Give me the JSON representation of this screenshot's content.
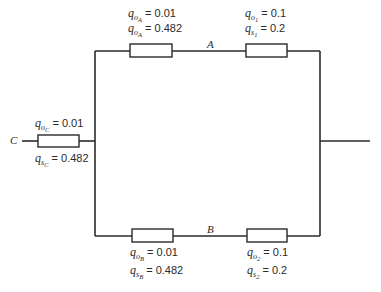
{
  "diagram": {
    "type": "reliability-network",
    "nodes": {
      "input": "C",
      "upper_branch": "A",
      "lower_branch": "B"
    },
    "components": {
      "C": {
        "q0": {
          "symbol": "q",
          "sub": "o",
          "subsub": "C",
          "eq": "= 0.01"
        },
        "qs": {
          "symbol": "q",
          "sub": "s",
          "subsub": "C",
          "eq": "= 0.482"
        }
      },
      "A_first": {
        "q0": {
          "symbol": "q",
          "sub": "o",
          "subsub": "A",
          "eq": "= 0.01"
        },
        "qs": {
          "symbol": "q",
          "sub": "o",
          "subsub": "A",
          "eq": "= 0.482"
        }
      },
      "A_second": {
        "q0": {
          "symbol": "q",
          "sub": "o",
          "subsub": "1",
          "eq": "= 0.1"
        },
        "qs": {
          "symbol": "q",
          "sub": "s",
          "subsub": "1",
          "eq": "= 0.2"
        }
      },
      "B_first": {
        "q0": {
          "symbol": "q",
          "sub": "o",
          "subsub": "B",
          "eq": "= 0.01"
        },
        "qs": {
          "symbol": "q",
          "sub": "s",
          "subsub": "B",
          "eq": "= 0.482"
        }
      },
      "B_second": {
        "q0": {
          "symbol": "q",
          "sub": "o",
          "subsub": "2",
          "eq": "= 0.1"
        },
        "qs": {
          "symbol": "q",
          "sub": "s",
          "subsub": "2",
          "eq": "= 0.2"
        }
      }
    },
    "colors": {
      "line": "#2a2a2a",
      "background": "#ffffff"
    }
  }
}
